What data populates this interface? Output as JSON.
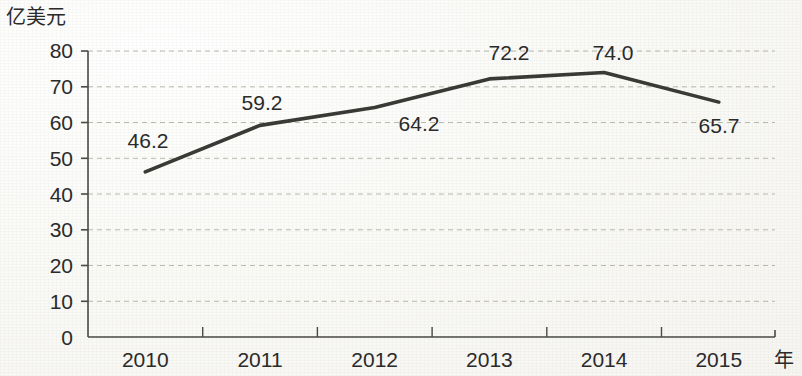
{
  "chart_data": {
    "type": "line",
    "title": "",
    "subtitle": "",
    "xlabel": "年",
    "ylabel": "亿美元",
    "categories": [
      "2010",
      "2011",
      "2012",
      "2013",
      "2014",
      "2015"
    ],
    "values": [
      46.2,
      59.2,
      64.2,
      72.2,
      74.0,
      65.7
    ],
    "point_labels": [
      "46.2",
      "59.2",
      "64.2",
      "72.2",
      "74.0",
      "65.7"
    ],
    "series": [
      {
        "name": "",
        "values": [
          46.2,
          59.2,
          64.2,
          72.2,
          74.0,
          65.7
        ]
      }
    ],
    "ylim": [
      0,
      80
    ],
    "ytick_step": 10,
    "yticks": [
      "0",
      "10",
      "20",
      "30",
      "40",
      "50",
      "60",
      "70",
      "80"
    ],
    "xticks": [
      "2010",
      "2011",
      "2012",
      "2013",
      "2014",
      "2015"
    ],
    "grid": "horizontal-dashed",
    "legend": "none",
    "line_color": "#3a3a36",
    "grid_color": "#b9b9ad",
    "axis_color": "#4a4a46",
    "background_color": "#fbfbf9",
    "text_color": "#2b2b2b"
  }
}
